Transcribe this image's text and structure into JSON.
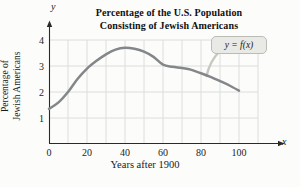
{
  "figure": {
    "title_line1": "Percentage of the U.S. Population",
    "title_line2": "Consisting of Jewish Americans",
    "y_axis_label_line1": "Percentage of",
    "y_axis_label_line2": "Jewish Americans",
    "x_axis_label": "Years after 1900",
    "curve_label": "y = f(x)",
    "x_axis_letter": "x",
    "y_axis_letter": "y"
  },
  "colors": {
    "curve": "#84878a",
    "grid": "#d7dcdb",
    "axis": "#2a2a2a",
    "tick_text": "#1d1d1d",
    "callout_fill": "#e9e9e5",
    "callout_border": "#bcbcb6",
    "callout_tail": "#c7c7c2"
  },
  "chart_data": {
    "type": "line",
    "title": "Percentage of the U.S. Population Consisting of Jewish Americans",
    "xlabel": "Years after 1900",
    "ylabel": "Percentage of Jewish Americans",
    "xlim": [
      0,
      115
    ],
    "ylim": [
      0,
      4.6
    ],
    "xticks": [
      0,
      20,
      40,
      60,
      80,
      100
    ],
    "yticks": [
      1,
      2,
      3,
      4
    ],
    "grid": true,
    "legend_position": "callout-on-curve",
    "series": [
      {
        "name": "y = f(x)",
        "x": [
          0,
          5,
          10,
          15,
          20,
          25,
          30,
          35,
          40,
          45,
          50,
          55,
          60,
          65,
          70,
          75,
          80,
          85,
          90,
          95,
          100
        ],
        "y": [
          1.35,
          1.6,
          2.0,
          2.5,
          2.9,
          3.2,
          3.45,
          3.63,
          3.7,
          3.66,
          3.55,
          3.35,
          3.05,
          2.97,
          2.92,
          2.85,
          2.72,
          2.58,
          2.42,
          2.25,
          2.05
        ]
      }
    ]
  }
}
